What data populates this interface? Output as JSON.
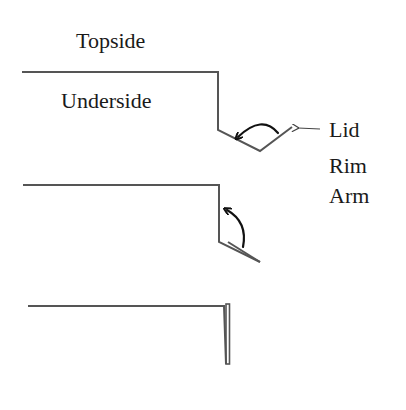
{
  "diagram": {
    "labels": {
      "topside": "Topside",
      "underside": "Underside",
      "lid": "Lid",
      "rim": "Rim",
      "arm": "Arm"
    },
    "stages": [
      {
        "name": "lid-open-obtuse",
        "description": "Lid angled outward below rim, curved arrow indicating fold back"
      },
      {
        "name": "lid-partially-folded",
        "description": "Lid folded close to rim, curved arrow indicating upward fold"
      },
      {
        "name": "lid-fully-folded",
        "description": "Lid folded flat against vertical rim"
      }
    ],
    "colors": {
      "outline": "#555555",
      "arrow": "#111111",
      "text": "#1a1a1a",
      "background": "#ffffff"
    }
  }
}
